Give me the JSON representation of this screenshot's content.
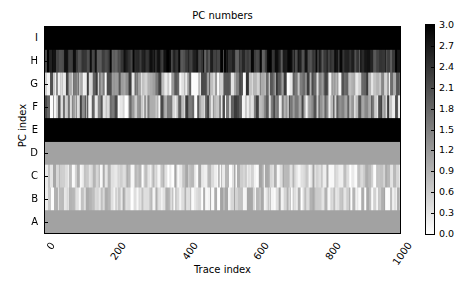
{
  "chart_data": {
    "type": "heatmap",
    "title": "PC numbers",
    "xlabel": "Trace index",
    "ylabel": "PC index",
    "xlim": [
      0,
      1000
    ],
    "x_ticks": [
      "0",
      "200",
      "400",
      "600",
      "800",
      "1000"
    ],
    "y_ticks_top_to_bottom": [
      "I",
      "H",
      "G",
      "F",
      "E",
      "D",
      "C",
      "B",
      "A"
    ],
    "colormap": "gray_r",
    "colorbar": {
      "range": [
        0.0,
        3.0
      ],
      "ticks": [
        "3.0",
        "2.7",
        "2.4",
        "2.1",
        "1.8",
        "1.5",
        "1.2",
        "0.9",
        "0.6",
        "0.3",
        "0.0"
      ]
    },
    "rows": [
      {
        "label": "I",
        "pattern": "constant",
        "value": 3.0
      },
      {
        "label": "H",
        "pattern": "varying",
        "range": [
          1.8,
          3.0
        ]
      },
      {
        "label": "G",
        "pattern": "varying",
        "range": [
          0.0,
          2.4
        ],
        "merged_with": "F"
      },
      {
        "label": "F",
        "pattern": "varying",
        "range": [
          0.0,
          2.4
        ],
        "merged_with": "G"
      },
      {
        "label": "E",
        "pattern": "constant",
        "value": 3.0
      },
      {
        "label": "D",
        "pattern": "constant",
        "value": 1.1
      },
      {
        "label": "C",
        "pattern": "varying",
        "range": [
          0.0,
          1.1
        ]
      },
      {
        "label": "B",
        "pattern": "varying",
        "range": [
          0.0,
          1.1
        ]
      },
      {
        "label": "A",
        "pattern": "constant",
        "value": 1.1
      }
    ]
  }
}
